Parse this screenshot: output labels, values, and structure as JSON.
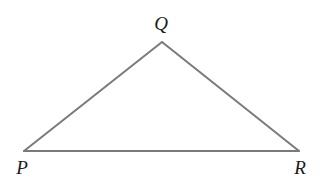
{
  "diagram": {
    "type": "triangle",
    "stroke_color": "#7a7a7a",
    "stroke_width": 2,
    "vertices": [
      {
        "label": "P",
        "x": 24,
        "y": 151,
        "label_x": 22,
        "label_y": 174
      },
      {
        "label": "Q",
        "x": 162,
        "y": 42,
        "label_x": 161,
        "label_y": 30
      },
      {
        "label": "R",
        "x": 299,
        "y": 151,
        "label_x": 300,
        "label_y": 174
      }
    ],
    "edges": [
      {
        "name": "PQ",
        "from": "P",
        "to": "Q"
      },
      {
        "name": "QR",
        "from": "Q",
        "to": "R"
      },
      {
        "name": "PR",
        "from": "P",
        "to": "R"
      }
    ]
  }
}
